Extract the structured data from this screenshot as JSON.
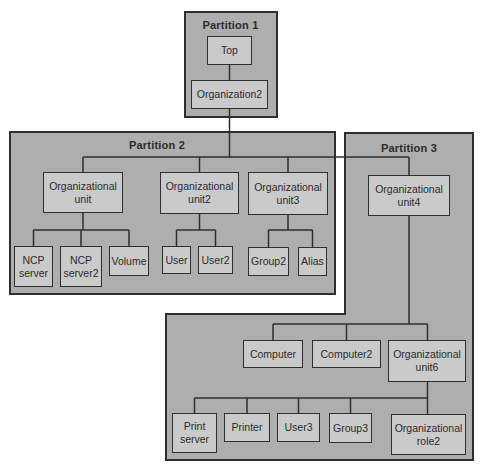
{
  "colors": {
    "page-bg": "#ffffff",
    "partition-fill": "#aeaeae",
    "node-fill": "#cacaca",
    "line": "#2f2f2f",
    "text": "#2b2b2b"
  },
  "partitions": [
    {
      "label": "Partition 1",
      "nodes": [
        {
          "label": "Top"
        },
        {
          "label": "Organization2"
        }
      ]
    },
    {
      "label": "Partition 2",
      "nodes": [
        {
          "label": "Organizational unit"
        },
        {
          "label": "Organizational unit2"
        },
        {
          "label": "Organizational unit3"
        },
        {
          "label": "NCP server"
        },
        {
          "label": "NCP server2"
        },
        {
          "label": "Volume"
        },
        {
          "label": "User"
        },
        {
          "label": "User2"
        },
        {
          "label": "Group2"
        },
        {
          "label": "Alias"
        }
      ]
    },
    {
      "label": "Partition 3",
      "nodes": [
        {
          "label": "Organizational unit4"
        },
        {
          "label": "Computer"
        },
        {
          "label": "Computer2"
        },
        {
          "label": "Organizational unit6"
        },
        {
          "label": "Print server"
        },
        {
          "label": "Printer"
        },
        {
          "label": "User3"
        },
        {
          "label": "Group3"
        },
        {
          "label": "Organizational role2"
        }
      ]
    }
  ],
  "tree": {
    "Top": [
      "Organization2"
    ],
    "Organization2": [
      "Organizational unit",
      "Organizational unit2",
      "Organizational unit3",
      "Organizational unit4"
    ],
    "Organizational unit": [
      "NCP server",
      "NCP server2",
      "Volume"
    ],
    "Organizational unit2": [
      "User",
      "User2"
    ],
    "Organizational unit3": [
      "Group2",
      "Alias"
    ],
    "Organizational unit4": [
      "Computer",
      "Computer2",
      "Organizational unit6"
    ],
    "Organizational unit6": [
      "Print server",
      "Printer",
      "User3",
      "Group3",
      "Organizational role2"
    ]
  }
}
